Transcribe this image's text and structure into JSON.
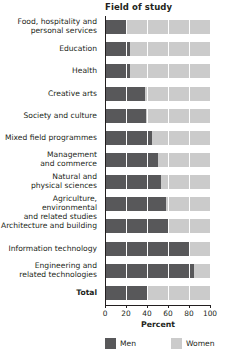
{
  "chart_data": {
    "type": "bar",
    "orientation": "horizontal",
    "stacked": true,
    "title": "Field of study",
    "xlabel": "Percent",
    "ylabel": "",
    "xlim": [
      0,
      100
    ],
    "xticks": [
      0,
      20,
      40,
      60,
      80,
      100
    ],
    "xticklabels": [
      "0",
      "20",
      "40",
      "60",
      "80",
      "100"
    ],
    "grid": true,
    "legend_position": "bottom",
    "categories": [
      "Food, hospitality and personal services",
      "Education",
      "Health",
      "Creative arts",
      "Society and culture",
      "Mixed field programmes",
      "Management and commerce",
      "Natural and physical sciences",
      "Agriculture, environmental and related studies",
      "Architecture and building",
      "Information technology",
      "Engineering and related technologies",
      "Total"
    ],
    "category_lines": [
      [
        "Food, hospitality and",
        "personal services"
      ],
      [
        "Education"
      ],
      [
        "Health"
      ],
      [
        "Creative arts"
      ],
      [
        "Society and culture"
      ],
      [
        "Mixed field programmes"
      ],
      [
        "Management",
        "and commerce"
      ],
      [
        "Natural and",
        "physical sciences"
      ],
      [
        "Agriculture, environmental",
        "and related studies"
      ],
      [
        "Architecture and building"
      ],
      [
        "Information technology"
      ],
      [
        "Engineering and",
        "related technologies"
      ],
      [
        "Total"
      ]
    ],
    "series": [
      {
        "name": "Men",
        "color": "#58585a",
        "values": [
          21,
          24,
          24,
          38,
          39,
          45,
          50,
          53,
          58,
          61,
          80,
          85,
          41
        ]
      },
      {
        "name": "Women",
        "color": "#cbcbcb",
        "values": [
          79,
          76,
          76,
          62,
          61,
          55,
          50,
          47,
          42,
          39,
          20,
          15,
          59
        ]
      }
    ]
  },
  "legend": {
    "items": [
      {
        "label": "Men",
        "color": "#58585a"
      },
      {
        "label": "Women",
        "color": "#cbcbcb"
      }
    ]
  }
}
